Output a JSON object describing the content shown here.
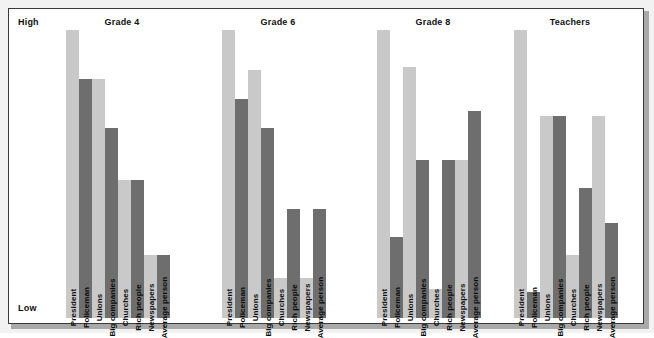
{
  "axis": {
    "high_label": "High",
    "low_label": "Low"
  },
  "colors": {
    "light_bar": "#c9c9c9",
    "dark_bar": "#6e6e6e",
    "frame_border": "#3a3a3a",
    "background": "#ffffff",
    "figure_background": "#f2f2f2",
    "shadow": "#a9a9a9",
    "text": "#101010"
  },
  "categories": [
    "President",
    "Policeman",
    "Unions",
    "Big companies",
    "Churches",
    "Rich people",
    "Newspapers",
    "Average person"
  ],
  "panels": [
    {
      "title": "Grade 4",
      "values": [
        100,
        83,
        83,
        66,
        48,
        48,
        22,
        22
      ]
    },
    {
      "title": "Grade 6",
      "values": [
        100,
        76,
        86,
        66,
        14,
        38,
        14,
        38
      ]
    },
    {
      "title": "Grade 8",
      "values": [
        100,
        28,
        87,
        55,
        10,
        55,
        55,
        72
      ]
    },
    {
      "title": "Teachers",
      "values": [
        100,
        9,
        70,
        70,
        22,
        45,
        70,
        33
      ]
    }
  ],
  "chart_data": {
    "type": "bar",
    "title": "",
    "subtitle": "",
    "xlabel": "",
    "ylabel": "",
    "ylim": [
      0,
      100
    ],
    "ytick_labels": [
      "Low",
      "High"
    ],
    "grid": false,
    "legend": "none",
    "panel_layout": "4 side-by-side panels sharing a common vertical Low-to-High scale",
    "categories": [
      "President",
      "Policeman",
      "Unions",
      "Big companies",
      "Churches",
      "Rich people",
      "Newspapers",
      "Average person"
    ],
    "series": [
      {
        "name": "Grade 4",
        "values": [
          100,
          83,
          83,
          66,
          48,
          48,
          22,
          22
        ]
      },
      {
        "name": "Grade 6",
        "values": [
          100,
          76,
          86,
          66,
          14,
          38,
          14,
          38
        ]
      },
      {
        "name": "Grade 8",
        "values": [
          100,
          28,
          87,
          55,
          10,
          55,
          55,
          72
        ]
      },
      {
        "name": "Teachers",
        "values": [
          100,
          9,
          70,
          70,
          22,
          45,
          70,
          33
        ]
      }
    ],
    "bar_shading": [
      "light",
      "dark",
      "light",
      "dark",
      "light",
      "dark",
      "light",
      "dark"
    ]
  }
}
